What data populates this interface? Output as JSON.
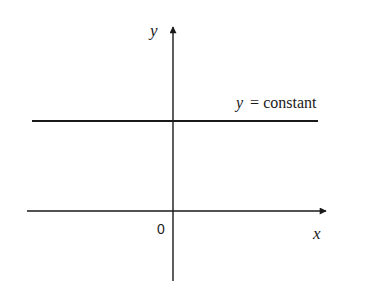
{
  "diagram": {
    "axes": {
      "x_label": "x",
      "y_label": "y",
      "origin_label": "0"
    },
    "line": {
      "label_var": "y",
      "label_eq": "= constant"
    },
    "colors": {
      "stroke": "#1a1a1a",
      "background": "#ffffff"
    }
  }
}
